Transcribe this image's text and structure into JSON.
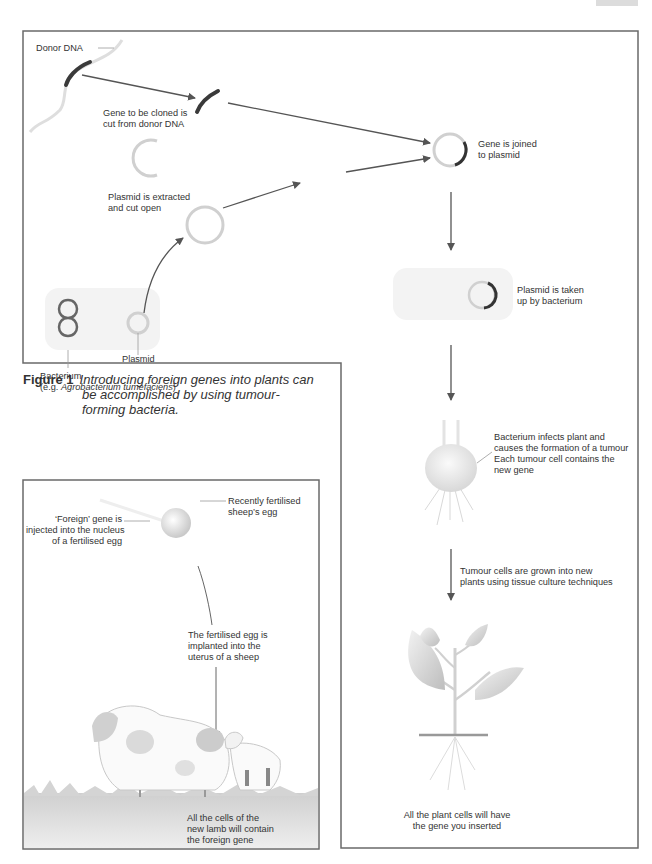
{
  "figure": {
    "number_label": "Figure 1",
    "caption_lines": [
      "Introducing foreign genes into plants can",
      "be accomplished by using tumour-",
      "forming bacteria."
    ]
  },
  "plant_panel": {
    "labels": {
      "donor_dna": "Donor DNA",
      "gene_cut_1": "Gene to be cloned is",
      "gene_cut_2": "cut from donor DNA",
      "gene_joined_1": "Gene is joined",
      "gene_joined_2": "to plasmid",
      "plasmid_extracted_1": "Plasmid is extracted",
      "plasmid_extracted_2": "and cut open",
      "plasmid": "Plasmid",
      "bacterium": "Bacterium",
      "bacterium_example_prefix": "(e.g. ",
      "bacterium_example_name": "Agrobacterium tumefaciens",
      "bacterium_example_suffix": ")",
      "plasmid_taken_1": "Plasmid is taken",
      "plasmid_taken_2": "up by bacterium",
      "infects_1": "Bacterium infects plant and",
      "infects_2": "causes the formation of a tumour",
      "infects_3": "Each tumour cell contains the",
      "infects_4": "new gene",
      "tumour_grown_1": "Tumour cells are grown into new",
      "tumour_grown_2": "plants using tissue culture techniques",
      "plant_cells_1": "All the plant cells will have",
      "plant_cells_2": "the gene you inserted"
    }
  },
  "sheep_panel": {
    "labels": {
      "egg_1": "Recently fertilised",
      "egg_2": "sheep’s egg",
      "foreign_1": "‘Foreign’ gene is",
      "foreign_2": "injected into the nucleus",
      "foreign_3": "of a fertilised egg",
      "implanted_1": "The fertilised egg is",
      "implanted_2": "implanted into the",
      "implanted_3": "uterus of a sheep",
      "lamb_1": "All the cells of the",
      "lamb_2": "new lamb will contain",
      "lamb_3": "the foreign gene"
    }
  },
  "colors": {
    "frame": "#6a6a6a",
    "arrow": "#555555",
    "gene": "#3a3a3a",
    "plasmid_ring": "#cfcfcf",
    "fill_light": "#ececec"
  }
}
